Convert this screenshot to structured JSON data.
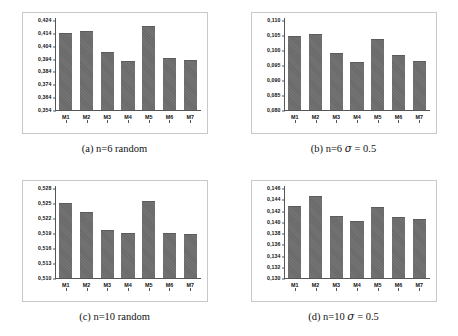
{
  "figure": {
    "panels": [
      {
        "id": "a",
        "caption_label": "(a)",
        "caption_text": "n=6 random",
        "caption_full": "(a) n=6 random"
      },
      {
        "id": "b",
        "caption_label": "(b)",
        "caption_text": "n=6 σ = 0.5",
        "caption_full": "(b) n=6 σ = 0.5"
      },
      {
        "id": "c",
        "caption_label": "(c)",
        "caption_text": "n=10 random",
        "caption_full": "(c) n=10 random"
      },
      {
        "id": "d",
        "caption_label": "(d)",
        "caption_text": "n=10 σ = 0.5",
        "caption_full": "(d) n=10 σ = 0.5"
      }
    ]
  },
  "style": {
    "bar_color": "#6e6e6e",
    "axis_color": "#555555",
    "frame_color": "#c8c8c8",
    "background": "#ffffff"
  },
  "chart_data": [
    {
      "type": "bar",
      "title": "(a) n=6 random",
      "xlabel": "",
      "ylabel": "",
      "categories": [
        "M1",
        "M2",
        "M3",
        "M4",
        "M5",
        "M6",
        "M7"
      ],
      "values": [
        0.4138,
        0.4156,
        0.399,
        0.3915,
        0.419,
        0.3945,
        0.3923
      ],
      "ylim": [
        0.354,
        0.424
      ],
      "yticks": [
        0.354,
        0.364,
        0.374,
        0.384,
        0.394,
        0.404,
        0.414,
        0.424
      ],
      "ytick_labels": [
        "0,354",
        "0,364",
        "0,374",
        "0,384",
        "0,394",
        "0,404",
        "0,414",
        "0,424"
      ],
      "grid": false,
      "legend": "none"
    },
    {
      "type": "bar",
      "title": "(b) n=6 σ = 0.5",
      "xlabel": "",
      "ylabel": "",
      "categories": [
        "M1",
        "M2",
        "M3",
        "M4",
        "M5",
        "M6",
        "M7"
      ],
      "values": [
        0.1045,
        0.1053,
        0.0988,
        0.0958,
        0.1036,
        0.0983,
        0.0961
      ],
      "ylim": [
        0.08,
        0.11
      ],
      "yticks": [
        0.08,
        0.085,
        0.09,
        0.095,
        0.1,
        0.105,
        0.11
      ],
      "ytick_labels": [
        "0,080",
        "0,085",
        "0,090",
        "0,095",
        "0,100",
        "0,105",
        "0,110"
      ],
      "grid": false,
      "legend": "none"
    },
    {
      "type": "bar",
      "title": "(c) n=10 random",
      "xlabel": "",
      "ylabel": "",
      "categories": [
        "M1",
        "M2",
        "M3",
        "M4",
        "M5",
        "M6",
        "M7"
      ],
      "values": [
        0.5249,
        0.5231,
        0.5196,
        0.5189,
        0.5254,
        0.5189,
        0.5188
      ],
      "ylim": [
        0.51,
        0.528
      ],
      "yticks": [
        0.51,
        0.513,
        0.516,
        0.519,
        0.522,
        0.525,
        0.528
      ],
      "ytick_labels": [
        "0,510",
        "0,513",
        "0,516",
        "0,519",
        "0,522",
        "0,525",
        "0,528"
      ],
      "grid": false,
      "legend": "none"
    },
    {
      "type": "bar",
      "title": "(d) n=10 σ = 0.5",
      "xlabel": "",
      "ylabel": "",
      "categories": [
        "M1",
        "M2",
        "M3",
        "M4",
        "M5",
        "M6",
        "M7"
      ],
      "values": [
        0.1427,
        0.1445,
        0.1409,
        0.1401,
        0.1426,
        0.1407,
        0.1404
      ],
      "ylim": [
        0.13,
        0.146
      ],
      "yticks": [
        0.13,
        0.132,
        0.134,
        0.136,
        0.138,
        0.14,
        0.142,
        0.144,
        0.146
      ],
      "ytick_labels": [
        "0,130",
        "0,132",
        "0,134",
        "0,136",
        "0,138",
        "0,140",
        "0,142",
        "0,144",
        "0,146"
      ],
      "grid": false,
      "legend": "none"
    }
  ]
}
